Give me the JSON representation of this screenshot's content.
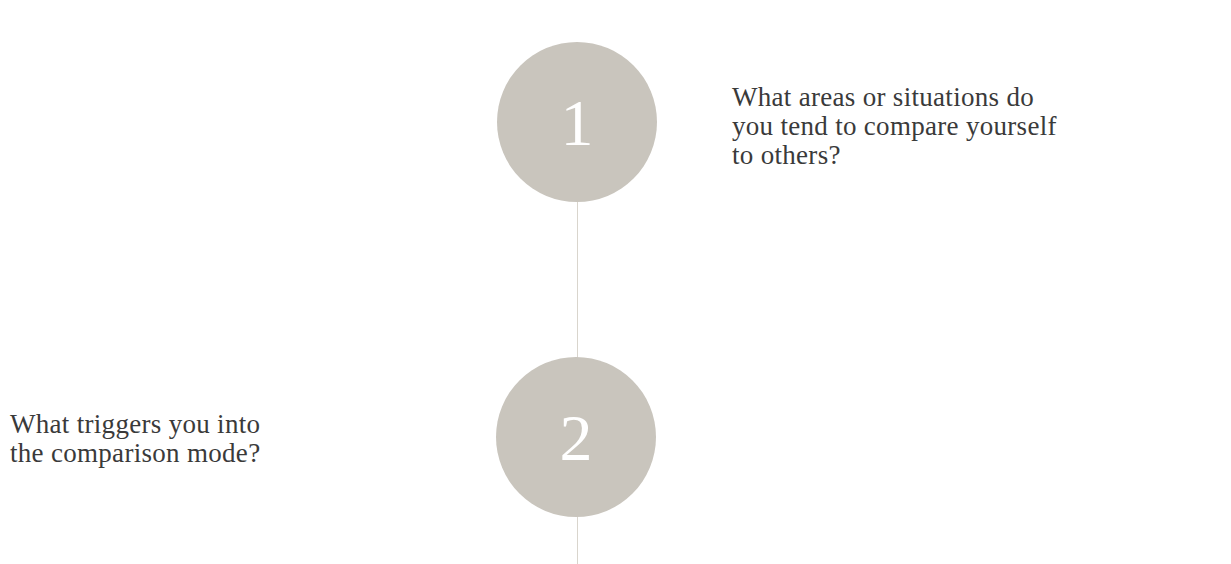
{
  "timeline": {
    "colors": {
      "circle": "#c9c5bd",
      "number": "#ffffff",
      "connector": "#d9d5cd",
      "text": "#3a3a3a"
    },
    "steps": [
      {
        "number": "1",
        "question_lines": [
          "What areas or situations do",
          "you tend to compare yourself",
          "to others?"
        ],
        "side": "right"
      },
      {
        "number": "2",
        "question_lines": [
          "What triggers you into",
          "the comparison mode?"
        ],
        "side": "left"
      }
    ]
  }
}
